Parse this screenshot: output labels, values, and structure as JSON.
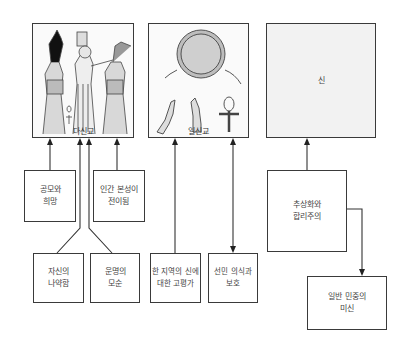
{
  "diagram": {
    "top_boxes": [
      {
        "id": "polytheism",
        "label": "다신교",
        "image": "egyptian-gods-illustration"
      },
      {
        "id": "monotheism",
        "label": "일신교",
        "image": "sun-disc-hands-ankh-illustration"
      },
      {
        "id": "god",
        "label": "신"
      }
    ],
    "middle_boxes": [
      {
        "id": "fear-hope",
        "label": "공모와\n희망"
      },
      {
        "id": "human-nature",
        "label": "인간 본성이\n전이됨"
      },
      {
        "id": "abstraction",
        "label": "추상화와\n합리주의"
      }
    ],
    "bottom_boxes": [
      {
        "id": "weakness",
        "label": "자신의\n나약함"
      },
      {
        "id": "fate",
        "label": "운명의\n모순"
      },
      {
        "id": "local-god",
        "label": "한 지역의 신에\n대한 고평가"
      },
      {
        "id": "chosen",
        "label": "선민 의식과\n보호"
      },
      {
        "id": "superstition",
        "label": "일반 민중의\n미신"
      }
    ],
    "connections": [
      {
        "from": "fear-hope",
        "to": "polytheism"
      },
      {
        "from": "human-nature",
        "to": "polytheism"
      },
      {
        "from": "weakness",
        "to": "polytheism"
      },
      {
        "from": "fate",
        "to": "polytheism"
      },
      {
        "from": "local-god",
        "to": "monotheism"
      },
      {
        "from": "monotheism",
        "to": "chosen"
      },
      {
        "from": "abstraction",
        "to": "god"
      },
      {
        "from": "abstraction",
        "to": "superstition"
      }
    ]
  }
}
